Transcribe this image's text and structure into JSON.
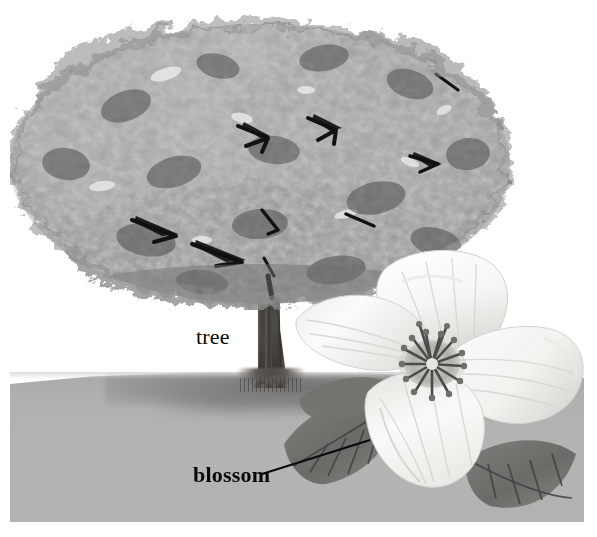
{
  "figure": {
    "kind": "illustration",
    "palette": {
      "page_background": "#ffffff",
      "ground": "#b2b2b2",
      "ground_shadow": "#6e6e6e",
      "canopy_light": "#b9b9b9",
      "canopy_mid": "#8f8f8f",
      "canopy_dark": "#5a5a5a",
      "branch_dark": "#141414",
      "trunk": "#4a4744",
      "trunk_dark": "#2e2b29",
      "petal_white": "#fdfdfc",
      "petal_shade": "#d7d7d4",
      "leaf_dark": "#6b6b68",
      "leaf_vein": "#3f3f3d",
      "stamen": "#4b4b49",
      "label_text": "#080808",
      "leader_line": "#0a0a0a"
    }
  },
  "labels": [
    {
      "id": "tree",
      "text": "tree",
      "weight": "regular",
      "has_leader": false
    },
    {
      "id": "blossom",
      "text": "blossom",
      "weight": "bold",
      "has_leader": true
    }
  ],
  "label_tree": "tree",
  "label_blossom": "blossom",
  "parts": {
    "canopy": "tree-canopy",
    "trunk": "tree-trunk",
    "ground": "ground-plane",
    "blossom": "dogwood-blossom",
    "petal_count": 4,
    "leaf_count": 3,
    "stamen_cluster": "stamen-cluster"
  }
}
